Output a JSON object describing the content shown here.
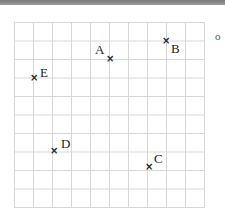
{
  "figure": {
    "type": "grid-points",
    "grid": {
      "columns": 10,
      "rows": 10
    },
    "marker": "×",
    "corner_glyph": "o",
    "points": [
      {
        "label": "A",
        "x": 110,
        "y": 59,
        "lx": 95,
        "ly": 44
      },
      {
        "label": "B",
        "x": 166,
        "y": 41,
        "lx": 172,
        "ly": 43
      },
      {
        "label": "C",
        "x": 149,
        "y": 167,
        "lx": 155,
        "ly": 154
      },
      {
        "label": "D",
        "x": 54,
        "y": 151,
        "lx": 61,
        "ly": 138
      },
      {
        "label": "E",
        "x": 34,
        "y": 78,
        "lx": 40,
        "ly": 66
      }
    ]
  }
}
